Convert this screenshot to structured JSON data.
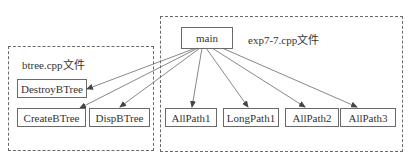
{
  "diagram": {
    "groups": [
      {
        "id": "exp",
        "label": "exp7-7.cpp文件"
      },
      {
        "id": "btree",
        "label": "btree.cpp文件"
      }
    ],
    "nodes": {
      "main": "main",
      "destroy": "DestroyBTree",
      "create": "CreateBTree",
      "disp": "DispBTree",
      "allpath1": "AllPath1",
      "longpath1": "LongPath1",
      "allpath2": "AllPath2",
      "allpath3": "AllPath3"
    },
    "edges": [
      {
        "from": "main",
        "to": "DestroyBTree"
      },
      {
        "from": "main",
        "to": "CreateBTree"
      },
      {
        "from": "main",
        "to": "DispBTree"
      },
      {
        "from": "main",
        "to": "AllPath1"
      },
      {
        "from": "main",
        "to": "LongPath1"
      },
      {
        "from": "main",
        "to": "AllPath2"
      },
      {
        "from": "main",
        "to": "AllPath3"
      }
    ],
    "colors": {
      "line": "#6a6a6a",
      "text": "#333333"
    }
  }
}
